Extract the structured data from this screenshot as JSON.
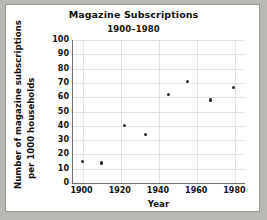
{
  "chart_data": {
    "type": "scatter",
    "title": "Magazine Subscriptions",
    "subtitle": "1900–1980",
    "xlabel": "Year",
    "ylabel_line1": "Number of magazine subscriptions",
    "ylabel_line2": "per 1000 households",
    "xlim": [
      1895,
      1985
    ],
    "ylim": [
      0,
      100
    ],
    "xticks": [
      1900,
      1920,
      1940,
      1960,
      1980
    ],
    "yticks": [
      0,
      10,
      20,
      30,
      40,
      50,
      60,
      70,
      80,
      90,
      100
    ],
    "grid": true,
    "legend": "none",
    "x": [
      1900,
      1910,
      1922,
      1933,
      1945,
      1955,
      1967,
      1979
    ],
    "y": [
      15,
      14,
      40,
      34,
      62,
      71,
      58,
      67
    ],
    "points": [
      {
        "x": 1900,
        "y": 15
      },
      {
        "x": 1910,
        "y": 14
      },
      {
        "x": 1922,
        "y": 40
      },
      {
        "x": 1933,
        "y": 34
      },
      {
        "x": 1945,
        "y": 62
      },
      {
        "x": 1955,
        "y": 71
      },
      {
        "x": 1967,
        "y": 58
      },
      {
        "x": 1979,
        "y": 67
      }
    ],
    "marker_color": "#2b2b2b",
    "grid_color": "#e2e2e2",
    "axis_color": "#6e6e6e",
    "background": "#ffffff",
    "page_background": "#b9b9b4"
  }
}
